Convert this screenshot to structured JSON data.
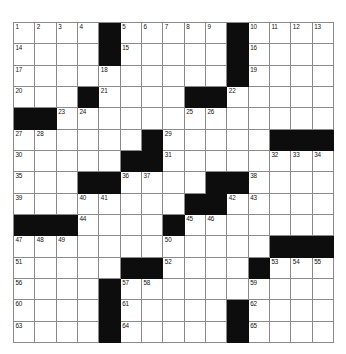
{
  "puzzle": {
    "type": "crossword-grid",
    "rows": 15,
    "columns": 15,
    "colors": {
      "block": "#0d0d0d",
      "cell": "#ffffff",
      "gridline": "#8a8a8a",
      "number": "#111111",
      "background": "#ffffff"
    },
    "grid": [
      [
        {
          "n": "1"
        },
        {
          "n": "2"
        },
        {
          "n": "3"
        },
        {
          "n": "4"
        },
        {
          "b": true
        },
        {
          "n": "5"
        },
        {
          "n": "6"
        },
        {
          "n": "7"
        },
        {
          "n": "8"
        },
        {
          "n": "9"
        },
        {
          "b": true
        },
        {
          "n": "10"
        },
        {
          "n": "11"
        },
        {
          "n": "12"
        },
        {
          "n": "13"
        }
      ],
      [
        {
          "n": "14"
        },
        {},
        {},
        {},
        {
          "b": true
        },
        {
          "n": "15"
        },
        {},
        {},
        {},
        {},
        {
          "b": true
        },
        {
          "n": "16"
        },
        {},
        {},
        {}
      ],
      [
        {
          "n": "17"
        },
        {},
        {},
        {},
        {
          "n": "18"
        },
        {},
        {},
        {},
        {},
        {},
        {
          "b": true
        },
        {
          "n": "19"
        },
        {},
        {},
        {}
      ],
      [
        {
          "n": "20"
        },
        {},
        {},
        {
          "b": true
        },
        {
          "n": "21"
        },
        {},
        {},
        {},
        {
          "b": true
        },
        {
          "b": true
        },
        {
          "n": "22"
        },
        {},
        {},
        {},
        {}
      ],
      [
        {
          "b": true
        },
        {
          "b": true
        },
        {
          "n": "23"
        },
        {
          "n": "24"
        },
        {},
        {},
        {},
        {},
        {
          "n": "25"
        },
        {
          "n": "26"
        },
        {},
        {},
        {},
        {},
        {}
      ],
      [
        {
          "n": "27"
        },
        {
          "n": "28"
        },
        {},
        {},
        {},
        {},
        {
          "b": true
        },
        {
          "n": "29"
        },
        {},
        {},
        {},
        {},
        {
          "b": true
        },
        {
          "b": true
        },
        {
          "b": true
        }
      ],
      [
        {
          "n": "30"
        },
        {},
        {},
        {},
        {},
        {
          "b": true
        },
        {
          "b": true
        },
        {
          "n": "31"
        },
        {},
        {},
        {},
        {},
        {
          "n": "32"
        },
        {
          "n": "33"
        },
        {
          "n": "34"
        }
      ],
      [
        {
          "n": "35"
        },
        {},
        {},
        {
          "b": true
        },
        {
          "b": true
        },
        {
          "n": "36"
        },
        {
          "n": "37"
        },
        {},
        {},
        {
          "b": true
        },
        {
          "b": true
        },
        {
          "n": "38"
        },
        {},
        {},
        {}
      ],
      [
        {
          "n": "39"
        },
        {},
        {},
        {
          "n": "40"
        },
        {
          "n": "41"
        },
        {},
        {},
        {},
        {
          "b": true
        },
        {
          "b": true
        },
        {
          "n": "42"
        },
        {
          "n": "43"
        },
        {},
        {},
        {}
      ],
      [
        {
          "b": true
        },
        {
          "b": true
        },
        {
          "b": true
        },
        {
          "n": "44"
        },
        {},
        {},
        {},
        {
          "b": true
        },
        {
          "n": "45"
        },
        {
          "n": "46"
        },
        {},
        {},
        {},
        {},
        {}
      ],
      [
        {
          "n": "47"
        },
        {
          "n": "48"
        },
        {
          "n": "49"
        },
        {},
        {},
        {},
        {},
        {
          "n": "50"
        },
        {},
        {},
        {},
        {},
        {
          "b": true
        },
        {
          "b": true
        },
        {
          "b": true
        }
      ],
      [
        {
          "n": "51"
        },
        {},
        {},
        {},
        {},
        {
          "b": true
        },
        {
          "b": true
        },
        {
          "n": "52"
        },
        {},
        {},
        {},
        {
          "b": true
        },
        {
          "n": "53"
        },
        {
          "n": "54"
        },
        {
          "n": "55"
        }
      ],
      [
        {
          "n": "56"
        },
        {},
        {},
        {},
        {
          "b": true
        },
        {
          "n": "57"
        },
        {
          "n": "58"
        },
        {},
        {},
        {},
        {},
        {
          "n": "59"
        },
        {},
        {},
        {}
      ],
      [
        {
          "n": "60"
        },
        {},
        {},
        {},
        {
          "b": true
        },
        {
          "n": "61"
        },
        {},
        {},
        {},
        {},
        {
          "b": true
        },
        {
          "n": "62"
        },
        {},
        {},
        {}
      ],
      [
        {
          "n": "63"
        },
        {},
        {},
        {},
        {
          "b": true
        },
        {
          "n": "64"
        },
        {},
        {},
        {},
        {},
        {
          "b": true
        },
        {
          "n": "65"
        },
        {},
        {},
        {}
      ]
    ]
  }
}
